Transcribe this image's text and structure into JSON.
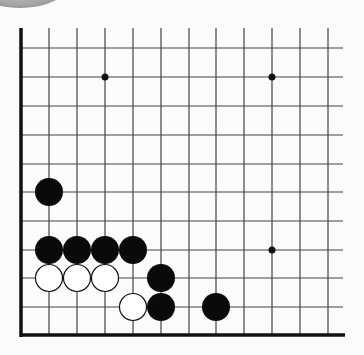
{
  "diagram": {
    "type": "go-board-fragment",
    "colors": {
      "background": "#fbfbfb",
      "grid_line": "#444444",
      "border": "#111111",
      "black_stone": "#0a0a0a",
      "white_stone_fill": "#ffffff",
      "white_stone_outline": "#111111"
    },
    "grid": {
      "columns_x": [
        21,
        49,
        77,
        105,
        133,
        161,
        189,
        216,
        244,
        272,
        300,
        328
      ],
      "rows_y": [
        48,
        77,
        106,
        135,
        164,
        192,
        221,
        250,
        278,
        307,
        335
      ],
      "top_open_y": 28,
      "right_open_x": 343,
      "left_edge_x": 21,
      "bottom_edge_y": 335
    },
    "star_points": [
      {
        "col": 3,
        "row": 1
      },
      {
        "col": 9,
        "row": 1
      },
      {
        "col": 9,
        "row": 7
      }
    ],
    "stones": [
      {
        "color": "black",
        "col": 1,
        "row": 5
      },
      {
        "color": "black",
        "col": 1,
        "row": 7
      },
      {
        "color": "black",
        "col": 2,
        "row": 7
      },
      {
        "color": "black",
        "col": 3,
        "row": 7
      },
      {
        "color": "black",
        "col": 4,
        "row": 7
      },
      {
        "color": "white",
        "col": 1,
        "row": 8
      },
      {
        "color": "white",
        "col": 2,
        "row": 8
      },
      {
        "color": "white",
        "col": 3,
        "row": 8
      },
      {
        "color": "black",
        "col": 5,
        "row": 8
      },
      {
        "color": "white",
        "col": 4,
        "row": 9
      },
      {
        "color": "black",
        "col": 5,
        "row": 9
      },
      {
        "color": "black",
        "col": 7,
        "row": 9
      }
    ]
  }
}
